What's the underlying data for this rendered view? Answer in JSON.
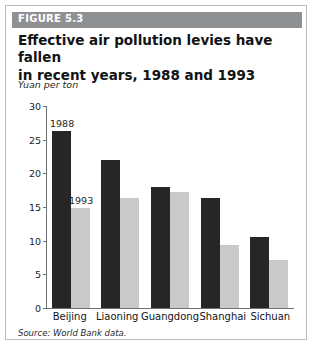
{
  "figure": {
    "label": "FIGURE 5.3",
    "title": "Effective air pollution levies have fallen in recent years, 1988 and 1993",
    "title_line1": "Effective air pollution levies have fallen",
    "title_line2": "in recent years, 1988 and 1993",
    "source": "Source: World Bank data.",
    "band_color": "#8e9194",
    "border_color": "#b9bcc0"
  },
  "chart_data": {
    "type": "bar",
    "title": "Effective air pollution levies have fallen in recent years, 1988 and 1993",
    "xlabel": "",
    "ylabel": "Yuan per ton",
    "ylim": [
      0,
      30
    ],
    "yticks": [
      0,
      5,
      10,
      15,
      20,
      25,
      30
    ],
    "ytick_labels": [
      "0",
      "5",
      "10",
      "15",
      "20",
      "25",
      "30"
    ],
    "grid": false,
    "legend": "inline-data-labels",
    "categories": [
      "Beijing",
      "Liaoning",
      "Guangdong",
      "Shanghai",
      "Sichuan"
    ],
    "series": [
      {
        "name": "1988",
        "color": "#262626",
        "values": [
          26.3,
          22.0,
          17.9,
          16.3,
          10.5
        ]
      },
      {
        "name": "1993",
        "color": "#c9c9c9",
        "values": [
          14.8,
          16.4,
          17.3,
          9.4,
          7.1
        ]
      }
    ],
    "annotations": [
      {
        "text": "1988",
        "series": "1988",
        "category": "Beijing"
      },
      {
        "text": "1993",
        "series": "1993",
        "category": "Beijing"
      }
    ]
  }
}
